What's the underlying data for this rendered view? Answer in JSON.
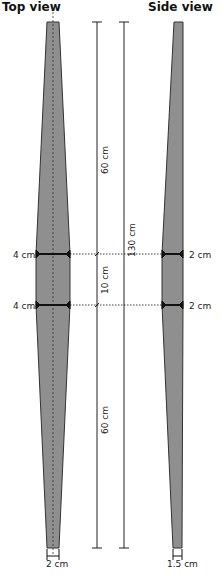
{
  "titles": {
    "top_view": "Top view",
    "side_view": "Side view"
  },
  "dimensions": {
    "upper_length": "60 cm",
    "middle_length": "10 cm",
    "lower_length": "60 cm",
    "total_length": "130 cm",
    "top_view_width_upper": "4 cm",
    "top_view_width_lower": "4 cm",
    "side_view_width_upper": "2 cm",
    "side_view_width_lower": "2 cm",
    "top_view_end_width": "2 cm",
    "side_view_end_width": "1.5 cm"
  },
  "colors": {
    "fill": "#8f8f8f",
    "stroke": "#333333",
    "line": "#222222"
  }
}
